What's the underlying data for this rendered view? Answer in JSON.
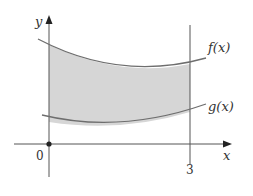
{
  "diagram": {
    "axes": {
      "x_label": "x",
      "y_label": "y",
      "origin_label": "0"
    },
    "ticks": {
      "x_tick_label": "3"
    },
    "curves": [
      {
        "name": "f",
        "label": "f(x)",
        "position": "upper"
      },
      {
        "name": "g",
        "label": "g(x)",
        "position": "lower"
      }
    ],
    "shaded_region": {
      "description": "area between f(x) and g(x) for 0 <= x <= 3",
      "x_start": "0",
      "x_end": "3"
    },
    "colors": {
      "axis": "#555555",
      "curve": "#6e6e6e",
      "fill": "#d6d6d6",
      "text": "#333333"
    }
  }
}
